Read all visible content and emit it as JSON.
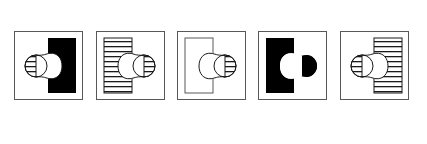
{
  "figure": {
    "type": "multiple-choice-answer-options",
    "orientation": "horizontal-row",
    "panel_count": 5,
    "background_color": "#ffffff",
    "frame_color": "#58585a",
    "fill_black": "#000000",
    "fill_white": "#ffffff",
    "stroke_color": "#1a1a1a",
    "label_color": "#6d6e70",
    "panel_size_px": 69,
    "panels": [
      {
        "label": "a",
        "name": "option-a",
        "rectangle": {
          "fill": "black",
          "side": "right",
          "x": 34,
          "y": 7,
          "width": 28,
          "height": 55
        },
        "left_circle": {
          "fill": "striped",
          "cx": 22,
          "cy": 35,
          "r": 11
        },
        "right_circle": {
          "fill": "white",
          "cx": 45,
          "cy": 35,
          "r": 13
        },
        "description": "black vertical rectangle on right; horizontally striped small circle at left joined to white larger circle over the black"
      },
      {
        "label": "b",
        "name": "option-b",
        "rectangle": {
          "fill": "striped",
          "side": "left",
          "x": 8,
          "y": 7,
          "width": 28,
          "height": 55
        },
        "left_circle": {
          "fill": "white",
          "cx": 23,
          "cy": 35,
          "r": 13
        },
        "right_circle": {
          "fill": "striped",
          "cx": 48,
          "cy": 35,
          "r": 11
        },
        "description": "horizontally striped vertical rectangle on left; white larger circle over the stripes joined to striped small circle at right"
      },
      {
        "label": "c",
        "name": "option-c",
        "rectangle": {
          "fill": "white",
          "side": "left",
          "x": 8,
          "y": 7,
          "width": 28,
          "height": 55
        },
        "left_circle": {
          "fill": "white",
          "cx": 23,
          "cy": 35,
          "r": 13
        },
        "right_circle": {
          "fill": "striped",
          "cx": 48,
          "cy": 35,
          "r": 11
        },
        "description": "plain outlined vertical rectangle on left; white larger circle inside it joined to striped small circle at right"
      },
      {
        "label": "d",
        "name": "option-d",
        "rectangle": {
          "fill": "black",
          "side": "left",
          "x": 8,
          "y": 7,
          "width": 28,
          "height": 55
        },
        "left_circle": {
          "fill": "white",
          "cx": 23,
          "cy": 35,
          "r": 13
        },
        "right_circle": {
          "fill": "black",
          "cx": 48,
          "cy": 35,
          "r": 11
        },
        "description": "black vertical rectangle on left; white larger circle over the black joined to solid black small circle at right"
      },
      {
        "label": "e",
        "name": "option-e",
        "rectangle": {
          "fill": "striped",
          "side": "right",
          "x": 34,
          "y": 7,
          "width": 28,
          "height": 55
        },
        "left_circle": {
          "fill": "striped",
          "cx": 22,
          "cy": 35,
          "r": 11
        },
        "right_circle": {
          "fill": "white",
          "cx": 45,
          "cy": 35,
          "r": 13
        },
        "description": "horizontally striped vertical rectangle on right; striped small circle at left joined to white larger circle over the stripes"
      }
    ]
  }
}
